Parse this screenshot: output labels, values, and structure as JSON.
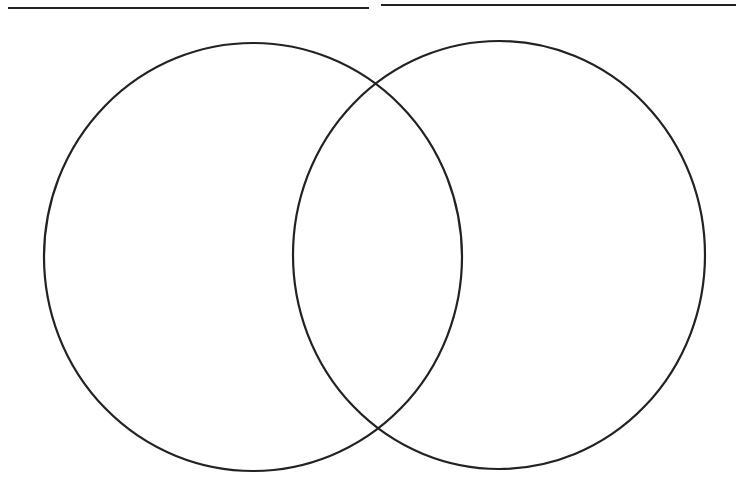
{
  "diagram": {
    "type": "venn",
    "sets": 2,
    "stroke_color": "#222222",
    "background": "#ffffff",
    "titles": [
      {
        "label": "",
        "placeholder": "left-title-line"
      },
      {
        "label": "",
        "placeholder": "right-title-line"
      }
    ],
    "circles": [
      {
        "name": "left",
        "cx": 253,
        "cy": 257,
        "rx": 209,
        "ry": 214
      },
      {
        "name": "right",
        "cx": 499,
        "cy": 255,
        "rx": 206,
        "ry": 214
      }
    ]
  }
}
